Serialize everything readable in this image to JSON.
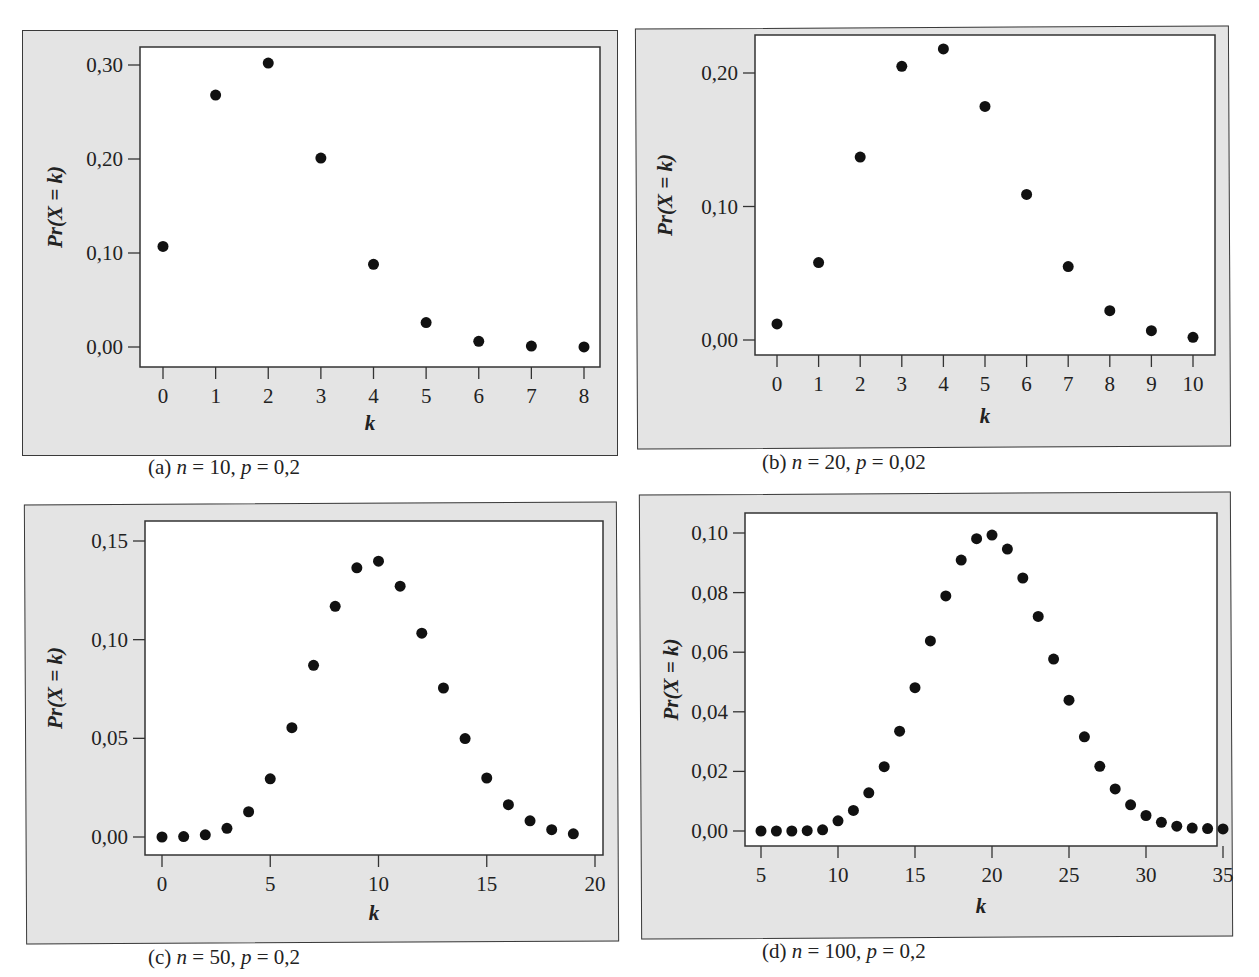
{
  "figure": {
    "panels": [
      {
        "id": "a",
        "caption_prefix": "(a) ",
        "n_label": "n",
        "n_value": " = 10, ",
        "p_label": "p",
        "p_value": " = 0,2"
      },
      {
        "id": "b",
        "caption_prefix": "(b) ",
        "n_label": "n",
        "n_value": " = 20, ",
        "p_label": "p",
        "p_value": " = 0,02"
      },
      {
        "id": "c",
        "caption_prefix": "(c) ",
        "n_label": "n",
        "n_value": " = 50, ",
        "p_label": "p",
        "p_value": " = 0,2"
      },
      {
        "id": "d",
        "caption_prefix": "(d) ",
        "n_label": "n",
        "n_value": " = 100, ",
        "p_label": "p",
        "p_value": " = 0,2"
      }
    ],
    "colors": {
      "panel_bg": "#e4e4e4",
      "plot_bg": "#ffffff",
      "marker": "#111111",
      "axis": "#333333"
    }
  },
  "chart_data": [
    {
      "type": "scatter",
      "title": "(a) n = 10, p = 0,2",
      "xlabel": "k",
      "ylabel": "Pr(X = k)",
      "x": [
        0,
        1,
        2,
        3,
        4,
        5,
        6,
        7,
        8
      ],
      "y": [
        0.107,
        0.268,
        0.302,
        0.201,
        0.088,
        0.026,
        0.006,
        0.001,
        0.0001
      ],
      "xticks": [
        0,
        1,
        2,
        3,
        4,
        5,
        6,
        7,
        8
      ],
      "xtick_labels": [
        "0",
        "1",
        "2",
        "3",
        "4",
        "5",
        "6",
        "7",
        "8"
      ],
      "yticks": [
        0.0,
        0.1,
        0.2,
        0.3
      ],
      "ytick_labels": [
        "0,00",
        "0,10",
        "0,20",
        "0,30"
      ],
      "grid": false
    },
    {
      "type": "scatter",
      "title": "(b) n = 20, p = 0,02",
      "xlabel": "k",
      "ylabel": "Pr(X = k)",
      "x": [
        0,
        1,
        2,
        3,
        4,
        5,
        6,
        7,
        8,
        9,
        10
      ],
      "y": [
        0.012,
        0.058,
        0.137,
        0.205,
        0.218,
        0.175,
        0.109,
        0.055,
        0.022,
        0.007,
        0.002
      ],
      "xticks": [
        0,
        1,
        2,
        3,
        4,
        5,
        6,
        7,
        8,
        9,
        10
      ],
      "xtick_labels": [
        "0",
        "1",
        "2",
        "3",
        "4",
        "5",
        "6",
        "7",
        "8",
        "9",
        "10"
      ],
      "yticks": [
        0.0,
        0.1,
        0.2
      ],
      "ytick_labels": [
        "0,00",
        "0,10",
        "0,20"
      ],
      "grid": false
    },
    {
      "type": "scatter",
      "title": "(c) n = 50, p = 0,2",
      "xlabel": "k",
      "ylabel": "Pr(X = k)",
      "x": [
        0,
        1,
        2,
        3,
        4,
        5,
        6,
        7,
        8,
        9,
        10,
        11,
        12,
        13,
        14,
        15,
        16,
        17,
        18,
        19
      ],
      "y": [
        0.0,
        0.0002,
        0.0011,
        0.0044,
        0.0128,
        0.0295,
        0.0554,
        0.087,
        0.1169,
        0.1364,
        0.1398,
        0.1271,
        0.1033,
        0.0755,
        0.0499,
        0.0299,
        0.0164,
        0.0082,
        0.0037,
        0.0016
      ],
      "xticks": [
        0,
        5,
        10,
        15,
        20
      ],
      "xtick_labels": [
        "0",
        "5",
        "10",
        "15",
        "20"
      ],
      "yticks": [
        0.0,
        0.05,
        0.1,
        0.15
      ],
      "ytick_labels": [
        "0,00",
        "0,05",
        "0,10",
        "0,15"
      ],
      "grid": false
    },
    {
      "type": "scatter",
      "title": "(d) n = 100, p = 0,2",
      "xlabel": "k",
      "ylabel": "Pr(X = k)",
      "x": [
        5,
        6,
        7,
        8,
        9,
        10,
        11,
        12,
        13,
        14,
        15,
        16,
        17,
        18,
        19,
        20,
        21,
        22,
        23,
        24,
        25,
        26,
        27,
        28,
        29,
        30,
        31,
        32,
        33,
        34,
        35
      ],
      "y": [
        0.0,
        0.0,
        0.0,
        0.0001,
        0.0004,
        0.0034,
        0.0069,
        0.0128,
        0.0216,
        0.0335,
        0.0481,
        0.0638,
        0.0789,
        0.0909,
        0.0981,
        0.0993,
        0.0946,
        0.0849,
        0.072,
        0.0577,
        0.0439,
        0.0316,
        0.0217,
        0.0141,
        0.0088,
        0.0052,
        0.0029,
        0.0016,
        0.001,
        0.0008,
        0.0007
      ],
      "xticks": [
        5,
        10,
        15,
        20,
        25,
        30,
        35
      ],
      "xtick_labels": [
        "5",
        "10",
        "15",
        "20",
        "25",
        "30",
        "35"
      ],
      "yticks": [
        0.0,
        0.02,
        0.04,
        0.06,
        0.08,
        0.1
      ],
      "ytick_labels": [
        "0,00",
        "0,02",
        "0,04",
        "0,06",
        "0,08",
        "0,10"
      ],
      "grid": false
    }
  ]
}
